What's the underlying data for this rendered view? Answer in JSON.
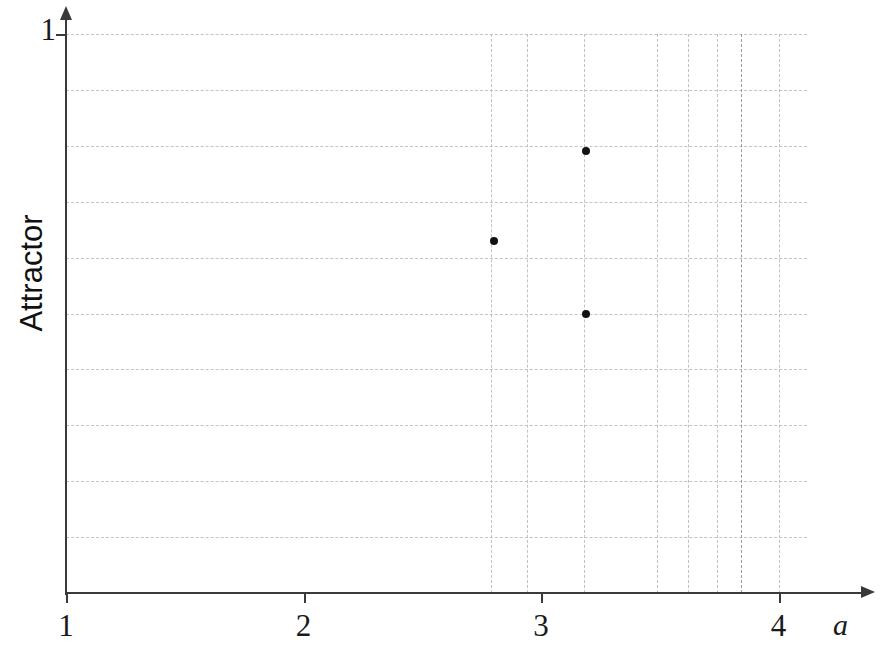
{
  "chart_data": {
    "type": "scatter",
    "title": "",
    "xlabel": "a",
    "ylabel": "Attractor",
    "xlim": [
      1,
      4.45
    ],
    "ylim": [
      0,
      1
    ],
    "grid": true,
    "legend": false,
    "x_ticks": [
      {
        "value": 1,
        "label": "1"
      },
      {
        "value": 2,
        "label": "2"
      },
      {
        "value": 3,
        "label": "3"
      },
      {
        "value": 4,
        "label": "4"
      }
    ],
    "y_ticks": [
      {
        "value": 1,
        "label": "1"
      }
    ],
    "x_gridlines": [
      2.79,
      2.94,
      3.18,
      3.49,
      3.62,
      3.74,
      3.84,
      4.0
    ],
    "y_gridlines": [
      1.0,
      0.9,
      0.8,
      0.7,
      0.6,
      0.5,
      0.4,
      0.3,
      0.2,
      0.1
    ],
    "points": [
      {
        "x": 3.19,
        "y": 0.79
      },
      {
        "x": 2.8,
        "y": 0.63
      },
      {
        "x": 3.19,
        "y": 0.5
      }
    ],
    "marker_color": "#121212",
    "grid_color": "#bcbcbc",
    "axis_color": "#3a3a3a"
  }
}
